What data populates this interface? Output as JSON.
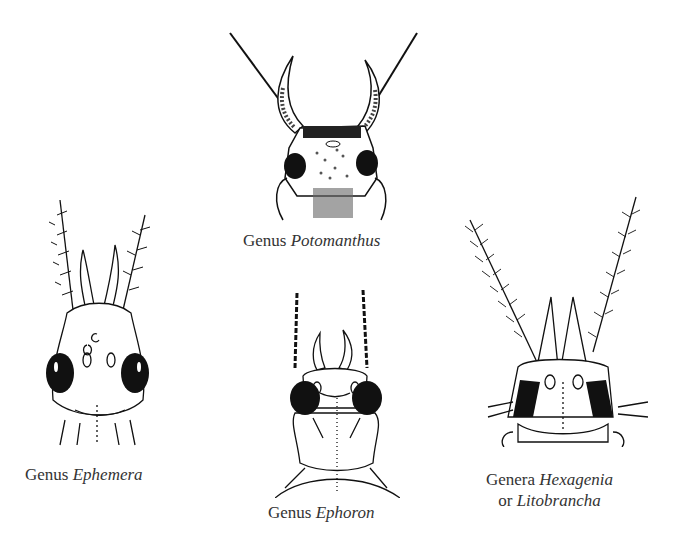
{
  "figure": {
    "panels": [
      {
        "id": "potomanthus",
        "caption_prefix": "Genus",
        "caption_name": "Potomanthus"
      },
      {
        "id": "ephemera",
        "caption_prefix": "Genus",
        "caption_name": "Ephemera"
      },
      {
        "id": "ephoron",
        "caption_prefix": "Genus",
        "caption_name": "Ephoron"
      },
      {
        "id": "hexagenia",
        "caption_prefix": "Genera",
        "caption_name": "Hexagenia",
        "caption_line2_prefix": "or",
        "caption_line2_name": "Litobrancha"
      }
    ]
  },
  "colors": {
    "background": "#ffffff",
    "ink": "#111111",
    "caption": "#333333"
  }
}
